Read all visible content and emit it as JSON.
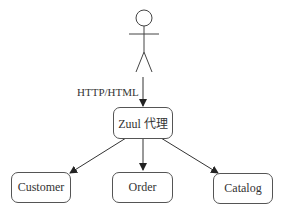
{
  "diagram": {
    "type": "architecture",
    "actor": {
      "name": "user"
    },
    "edge_label": "HTTP/HTML",
    "proxy": {
      "label": "Zuul 代理"
    },
    "services": [
      {
        "label": "Customer"
      },
      {
        "label": "Order"
      },
      {
        "label": "Catalog"
      }
    ],
    "edges": [
      {
        "from": "user",
        "to": "Zuul 代理",
        "label": "HTTP/HTML"
      },
      {
        "from": "Zuul 代理",
        "to": "Customer"
      },
      {
        "from": "Zuul 代理",
        "to": "Order"
      },
      {
        "from": "Zuul 代理",
        "to": "Catalog"
      }
    ],
    "colors": {
      "stroke": "#555555",
      "text": "#333333",
      "background": "#ffffff"
    }
  }
}
